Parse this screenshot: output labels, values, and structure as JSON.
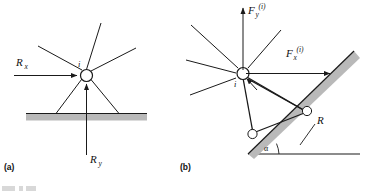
{
  "figure": {
    "panels": [
      {
        "caption": "(a)",
        "node_label": "i",
        "forces": [
          {
            "name": "reaction-x",
            "base": "R",
            "sub": "x",
            "sup": "",
            "direction": "right"
          },
          {
            "name": "reaction-y",
            "base": "R",
            "sub": "y",
            "sup": "",
            "direction": "up"
          }
        ],
        "support_type": "pinned-support",
        "ground_type": "horizontal-ground"
      },
      {
        "caption": "(b)",
        "node_label": "i",
        "forces": [
          {
            "name": "force-y",
            "base": "F",
            "sub": "y",
            "sup": "(i)",
            "direction": "up"
          },
          {
            "name": "force-x",
            "base": "F",
            "sub": "x",
            "sup": "(i)",
            "direction": "right"
          }
        ],
        "resultant_label": "R",
        "angle_label": "α",
        "support_type": "roller-support",
        "ground_type": "inclined-plane"
      }
    ]
  },
  "colors": {
    "line": "#1a1a1a",
    "ground_fill": "#b9b9b9",
    "node_fill": "#ffffff",
    "background": "#ffffff"
  }
}
